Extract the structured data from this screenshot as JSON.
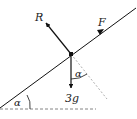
{
  "diagram": {
    "type": "inclined-plane-force-diagram",
    "labels": {
      "normal_reaction": "R",
      "applied_force": "F",
      "weight": "3g",
      "angle_at_particle": "α",
      "angle_of_incline": "α"
    },
    "colors": {
      "line": "#111111",
      "dashed": "#888888",
      "text": "#222222",
      "background": "#ffffff"
    }
  }
}
